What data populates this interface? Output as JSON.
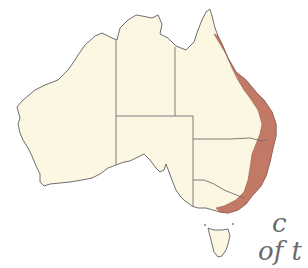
{
  "map": {
    "subject": "Australia",
    "land_color": "#fbf7e3",
    "outline_color": "#6f6f6f",
    "range_color": "#c27a66",
    "range_description": "Shaded distribution along east coast from Cape York to eastern Victoria",
    "states": [
      "Western Australia",
      "Northern Territory",
      "South Australia",
      "Queensland",
      "New South Wales",
      "Victoria",
      "Tasmania"
    ]
  },
  "caption": {
    "line1": "c",
    "line2": "of t"
  }
}
